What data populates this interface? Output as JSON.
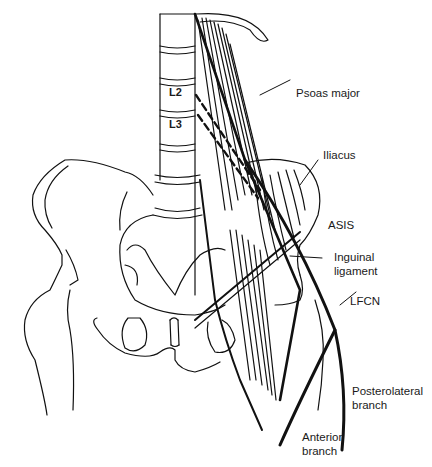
{
  "figure": {
    "type": "anatomical-illustration",
    "colors": {
      "line": "#111111",
      "background": "#ffffff"
    }
  },
  "vertebra_labels": {
    "l2": "L2",
    "l3": "L3"
  },
  "labels": {
    "psoas_major": "Psoas major",
    "iliacus": "Iliacus",
    "asis": "ASIS",
    "inguinal_ligament": "Inguinal\nligament",
    "lfcn": "LFCN",
    "posterolateral_branch": "Posterolateral\nbranch",
    "anterior_branch": "Anterior\nbranch"
  }
}
